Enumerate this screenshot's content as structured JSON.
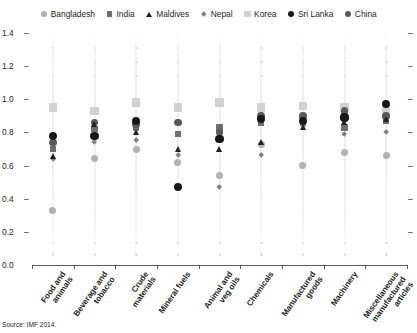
{
  "source_note": "Source: IMF 2014.",
  "chart_data": {
    "type": "scatter",
    "title": "",
    "subtitle": "",
    "xlabel": "",
    "ylabel": "",
    "ylim": [
      0.0,
      1.4
    ],
    "yticks": [
      "0.0",
      "0.2",
      "0.4",
      "0.6",
      "0.8",
      "1.0",
      "1.2",
      "1.4"
    ],
    "ytick_values": [
      0.0,
      0.2,
      0.4,
      0.6,
      0.8,
      1.0,
      1.2,
      1.4
    ],
    "grid": false,
    "legend_position": "top-center",
    "categories": [
      "Food and\nanimals",
      "Beverage and\ntobacco",
      "Crude\nmaterials",
      "Mineral fuels",
      "Animal and\nveg oils",
      "Chemicals",
      "Manufactured\ngoods",
      "Machinery",
      "Miscellaneous\nmanufactured\narticles"
    ],
    "legend": [
      {
        "name": "Bangladesh",
        "marker": "circle",
        "color": "#b0b2b4",
        "size": 7.0
      },
      {
        "name": "India",
        "marker": "square",
        "color": "#6d6e70",
        "size": 6.6
      },
      {
        "name": "Maldives",
        "marker": "triangle",
        "color": "#231f20",
        "size": 6.8
      },
      {
        "name": "Nepal",
        "marker": "diamond",
        "color": "#808285",
        "size": 6.0
      },
      {
        "name": "Korea",
        "marker": "square",
        "color": "#cfd1d2",
        "size": 8.4
      },
      {
        "name": "Sri Lanka",
        "marker": "circle",
        "color": "#1a1718",
        "size": 8.2
      },
      {
        "name": "China",
        "marker": "circle",
        "color": "#58595b",
        "size": 7.6
      }
    ],
    "series": [
      {
        "name": "Bangladesh",
        "values": [
          0.33,
          0.64,
          0.7,
          0.62,
          0.54,
          0.73,
          0.6,
          0.68,
          0.66
        ]
      },
      {
        "name": "India",
        "values": [
          0.7,
          0.82,
          0.83,
          0.79,
          0.83,
          0.86,
          0.86,
          0.83,
          0.87
        ]
      },
      {
        "name": "Maldives",
        "values": [
          0.66,
          0.85,
          0.8,
          0.7,
          0.7,
          0.74,
          0.83,
          0.86,
          0.88
        ]
      },
      {
        "name": "Nepal",
        "values": [
          0.64,
          0.74,
          0.75,
          0.66,
          0.47,
          0.66,
          0.84,
          0.79,
          0.8
        ]
      },
      {
        "name": "Korea",
        "values": [
          0.95,
          0.93,
          0.98,
          0.95,
          0.98,
          0.95,
          0.96,
          0.95,
          0.93
        ]
      },
      {
        "name": "Sri Lanka",
        "values": [
          0.78,
          0.78,
          0.87,
          0.47,
          0.76,
          0.88,
          0.87,
          0.89,
          0.97
        ]
      },
      {
        "name": "China",
        "values": [
          0.74,
          0.86,
          0.85,
          0.86,
          0.8,
          0.9,
          0.9,
          0.93,
          0.9
        ]
      }
    ]
  }
}
